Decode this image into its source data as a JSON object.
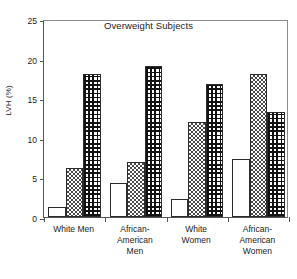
{
  "chart_data": {
    "type": "bar",
    "title": "Overweight Subjects",
    "xlabel": "",
    "ylabel": "LVH (%)",
    "ylim": [
      0,
      25
    ],
    "yticks": [
      0,
      5,
      10,
      15,
      20,
      25
    ],
    "ytick_labels": [
      "0",
      "5",
      "10",
      "15",
      "20",
      "25"
    ],
    "grid": false,
    "legend": "none",
    "categories": [
      "White Men",
      "African-American Men",
      "White Women",
      "African-American Women"
    ],
    "category_label_lines": [
      [
        "White Men"
      ],
      [
        "African-",
        "American",
        "Men"
      ],
      [
        "White",
        "Women"
      ],
      [
        "African-",
        "American",
        "Women"
      ]
    ],
    "series": [
      {
        "name": "Series 1",
        "pattern": "open",
        "values": [
          1.3,
          4.3,
          2.3,
          7.3
        ]
      },
      {
        "name": "Series 2",
        "pattern": "checkerboard",
        "values": [
          6.2,
          7.0,
          12.0,
          18.1
        ]
      },
      {
        "name": "Series 3",
        "pattern": "dense-grid",
        "values": [
          18.1,
          19.1,
          16.8,
          13.3
        ]
      }
    ],
    "colors": {
      "axis": "#555555",
      "frame": "#8c8c8c",
      "bar_outline": "#2b2b2b",
      "pattern_dark": "#121212",
      "pattern_mid": "#4a4a4a",
      "background": "#ffffff",
      "text": "#1a1a1a"
    }
  }
}
